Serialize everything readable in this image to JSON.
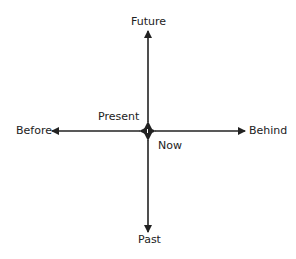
{
  "diagram": {
    "labels": {
      "future": "Future",
      "past": "Past",
      "before": "Before",
      "behind": "Behind",
      "present": "Present",
      "now": "Now"
    },
    "colors": {
      "arrow": "#222222",
      "text": "#222222"
    }
  }
}
